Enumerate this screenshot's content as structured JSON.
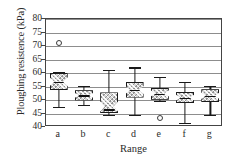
{
  "chart_data": {
    "type": "boxplot",
    "title": "",
    "xlabel": "Range",
    "ylabel": "Ploughing resistence (kPa)",
    "ylim": [
      40,
      80
    ],
    "yticks": [
      40,
      45,
      50,
      55,
      60,
      65,
      70,
      75,
      80
    ],
    "ytick_labels": [
      "40",
      "45",
      "50",
      "55",
      "60",
      "65",
      "70",
      "75",
      "80"
    ],
    "grid": true,
    "legend": "none",
    "categories": [
      "a",
      "b",
      "c",
      "d",
      "e",
      "f",
      "g"
    ],
    "boxes": [
      {
        "category": "a",
        "whisker_low": 47.5,
        "q1": 53.7,
        "median": 56.8,
        "q3": 60.0,
        "whisker_high": 60.2,
        "notch_low": 55.1,
        "notch_high": 58.4,
        "outliers": [
          71.2
        ]
      },
      {
        "category": "b",
        "whisker_low": 48.2,
        "q1": 49.8,
        "median": 51.7,
        "q3": 53.6,
        "whisker_high": 55.3,
        "notch_low": 50.8,
        "notch_high": 52.6,
        "outliers": []
      },
      {
        "category": "c",
        "whisker_low": 44.6,
        "q1": 45.0,
        "median": 46.5,
        "q3": 52.8,
        "whisker_high": 61.2,
        "notch_low": 45.6,
        "notch_high": 49.5,
        "outliers": []
      },
      {
        "category": "d",
        "whisker_low": 44.5,
        "q1": 50.9,
        "median": 53.8,
        "q3": 56.8,
        "whisker_high": 62.1,
        "notch_low": 52.2,
        "notch_high": 55.2,
        "outliers": []
      },
      {
        "category": "e",
        "whisker_low": 49.6,
        "q1": 50.1,
        "median": 52.4,
        "q3": 54.6,
        "whisker_high": 58.7,
        "notch_low": 51.3,
        "notch_high": 53.6,
        "outliers": [
          43.3
        ]
      },
      {
        "category": "f",
        "whisker_low": 41.5,
        "q1": 48.9,
        "median": 50.8,
        "q3": 53.0,
        "whisker_high": 56.6,
        "notch_low": 49.8,
        "notch_high": 51.9,
        "outliers": []
      },
      {
        "category": "g",
        "whisker_low": 44.6,
        "q1": 49.3,
        "median": 51.6,
        "q3": 54.0,
        "whisker_high": 55.1,
        "notch_low": 50.4,
        "notch_high": 52.8,
        "outliers": []
      }
    ]
  },
  "axes": {
    "ylabel": "Ploughing resistence (kPa)",
    "xlabel": "Range"
  }
}
